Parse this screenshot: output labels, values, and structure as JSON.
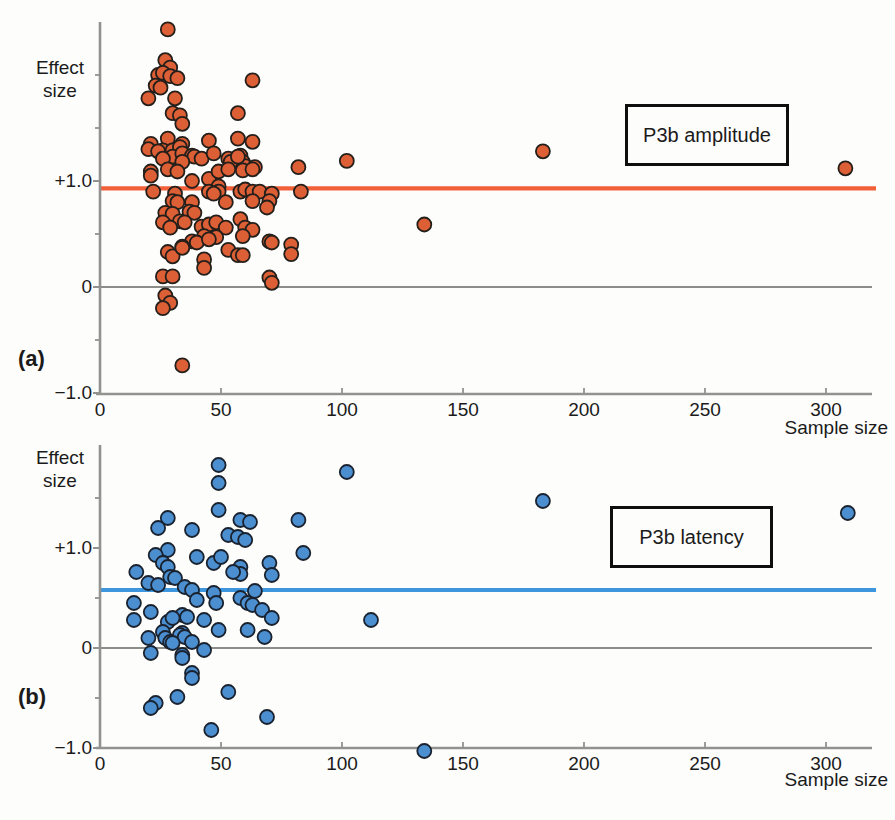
{
  "figure": {
    "background": "#fdfdfb",
    "text_color": "#1b1b1b",
    "axis_color": "#92928e",
    "zero_line_color": "#8c8c88"
  },
  "chart_data": [
    {
      "type": "scatter",
      "panel_label": "(a)",
      "legend_label": "P3b amplitude",
      "ylabel": "Effect size",
      "xlabel": "Sample size",
      "x_ticks": [
        0,
        50,
        100,
        150,
        200,
        250,
        300
      ],
      "y_labeled_ticks": [
        {
          "value": 1.0,
          "label": "+1.0"
        },
        {
          "value": 0,
          "label": "0"
        },
        {
          "value": -1.0,
          "label": "−1.0"
        }
      ],
      "y_minor_ticks": [
        -0.5,
        0.5,
        1.5,
        2.0
      ],
      "xlim": [
        0,
        319
      ],
      "ylim": [
        -1.05,
        2.52
      ],
      "grid": false,
      "legend_position": "upper right box",
      "grand_mean_effect_size": 0.93,
      "colors": {
        "point_fill": "#DC5F36",
        "point_stroke": "#241f1a",
        "mean_line": "#F2603A"
      },
      "points": [
        [
          28,
          2.43
        ],
        [
          27,
          2.14
        ],
        [
          29,
          2.07
        ],
        [
          24,
          2.0
        ],
        [
          26,
          2.02
        ],
        [
          29,
          1.99
        ],
        [
          32,
          1.97
        ],
        [
          23,
          1.9
        ],
        [
          25,
          1.88
        ],
        [
          20,
          1.78
        ],
        [
          31,
          1.78
        ],
        [
          63,
          1.95
        ],
        [
          30,
          1.64
        ],
        [
          33,
          1.62
        ],
        [
          34,
          1.54
        ],
        [
          57,
          1.64
        ],
        [
          28,
          1.4
        ],
        [
          57,
          1.4
        ],
        [
          63,
          1.37
        ],
        [
          21,
          1.35
        ],
        [
          34,
          1.35
        ],
        [
          20,
          1.3
        ],
        [
          26,
          1.29
        ],
        [
          30,
          1.29
        ],
        [
          33,
          1.32
        ],
        [
          45,
          1.38
        ],
        [
          24,
          1.28
        ],
        [
          30,
          1.23
        ],
        [
          34,
          1.26
        ],
        [
          38,
          1.24
        ],
        [
          39,
          1.23
        ],
        [
          42,
          1.21
        ],
        [
          47,
          1.26
        ],
        [
          53,
          1.21
        ],
        [
          58,
          1.24
        ],
        [
          59,
          1.18
        ],
        [
          60,
          1.14
        ],
        [
          26,
          1.21
        ],
        [
          34,
          1.18
        ],
        [
          82,
          1.13
        ],
        [
          102,
          1.19
        ],
        [
          21,
          1.09
        ],
        [
          28,
          1.11
        ],
        [
          32,
          1.09
        ],
        [
          38,
          1.0
        ],
        [
          45,
          1.02
        ],
        [
          49,
          1.09
        ],
        [
          54,
          1.18
        ],
        [
          59,
          1.1
        ],
        [
          64,
          1.13
        ],
        [
          53,
          1.11
        ],
        [
          57,
          1.23
        ],
        [
          63,
          1.11
        ],
        [
          21,
          1.05
        ],
        [
          49,
          0.95
        ],
        [
          22,
          0.9
        ],
        [
          31,
          0.88
        ],
        [
          30,
          0.81
        ],
        [
          32,
          0.8
        ],
        [
          38,
          0.8
        ],
        [
          45,
          0.9
        ],
        [
          49,
          0.9
        ],
        [
          52,
          0.8
        ],
        [
          58,
          0.9
        ],
        [
          60,
          0.92
        ],
        [
          63,
          0.9
        ],
        [
          66,
          0.9
        ],
        [
          71,
          0.88
        ],
        [
          63,
          0.81
        ],
        [
          70,
          0.81
        ],
        [
          69,
          0.75
        ],
        [
          83,
          0.9
        ],
        [
          47,
          0.88
        ],
        [
          27,
          0.7
        ],
        [
          30,
          0.69
        ],
        [
          37,
          0.71
        ],
        [
          39,
          0.7
        ],
        [
          33,
          0.62
        ],
        [
          26,
          0.61
        ],
        [
          29,
          0.56
        ],
        [
          35,
          0.61
        ],
        [
          42,
          0.57
        ],
        [
          45,
          0.59
        ],
        [
          48,
          0.61
        ],
        [
          52,
          0.56
        ],
        [
          58,
          0.64
        ],
        [
          60,
          0.56
        ],
        [
          63,
          0.54
        ],
        [
          59,
          0.48
        ],
        [
          43,
          0.48
        ],
        [
          48,
          0.47
        ],
        [
          38,
          0.43
        ],
        [
          53,
          0.35
        ],
        [
          70,
          0.43
        ],
        [
          79,
          0.4
        ],
        [
          79,
          0.31
        ],
        [
          71,
          0.42
        ],
        [
          28,
          0.33
        ],
        [
          30,
          0.29
        ],
        [
          34,
          0.38
        ],
        [
          40,
          0.42
        ],
        [
          45,
          0.45
        ],
        [
          34,
          0.37
        ],
        [
          43,
          0.26
        ],
        [
          43,
          0.18
        ],
        [
          57,
          0.3
        ],
        [
          59,
          0.3
        ],
        [
          70,
          0.09
        ],
        [
          26,
          0.1
        ],
        [
          30,
          0.1
        ],
        [
          71,
          0.04
        ],
        [
          27,
          -0.08
        ],
        [
          29,
          -0.15
        ],
        [
          26,
          -0.2
        ],
        [
          34,
          -0.74
        ],
        [
          134,
          0.59
        ],
        [
          183,
          1.28
        ],
        [
          308,
          1.12
        ]
      ]
    },
    {
      "type": "scatter",
      "panel_label": "(b)",
      "legend_label": "P3b latency",
      "ylabel": "Effect size",
      "xlabel": "Sample size",
      "x_ticks": [
        0,
        50,
        100,
        150,
        200,
        250,
        300
      ],
      "y_labeled_ticks": [
        {
          "value": 1.0,
          "label": "+1.0"
        },
        {
          "value": 0,
          "label": "0"
        },
        {
          "value": -1.0,
          "label": "−1.0"
        }
      ],
      "y_minor_ticks": [
        -0.5,
        0.5,
        1.5
      ],
      "xlim": [
        0,
        319
      ],
      "ylim": [
        -1.03,
        2.03
      ],
      "grid": false,
      "legend_position": "upper right box",
      "grand_mean_effect_size": 0.58,
      "colors": {
        "point_fill": "#4C8FD1",
        "point_stroke": "#19222e",
        "mean_line": "#3E97DE"
      },
      "points": [
        [
          49,
          1.83
        ],
        [
          49,
          1.65
        ],
        [
          102,
          1.76
        ],
        [
          28,
          1.3
        ],
        [
          24,
          1.2
        ],
        [
          49,
          1.38
        ],
        [
          58,
          1.28
        ],
        [
          62,
          1.26
        ],
        [
          38,
          1.18
        ],
        [
          53,
          1.13
        ],
        [
          57,
          1.11
        ],
        [
          60,
          1.08
        ],
        [
          82,
          1.28
        ],
        [
          84,
          0.95
        ],
        [
          28,
          0.98
        ],
        [
          23,
          0.93
        ],
        [
          26,
          0.85
        ],
        [
          28,
          0.81
        ],
        [
          40,
          0.91
        ],
        [
          47,
          0.85
        ],
        [
          50,
          0.91
        ],
        [
          58,
          0.81
        ],
        [
          58,
          0.74
        ],
        [
          70,
          0.85
        ],
        [
          71,
          0.73
        ],
        [
          55,
          0.76
        ],
        [
          15,
          0.76
        ],
        [
          20,
          0.65
        ],
        [
          29,
          0.71
        ],
        [
          31,
          0.7
        ],
        [
          24,
          0.63
        ],
        [
          35,
          0.61
        ],
        [
          38,
          0.58
        ],
        [
          14,
          0.45
        ],
        [
          21,
          0.36
        ],
        [
          40,
          0.48
        ],
        [
          47,
          0.55
        ],
        [
          48,
          0.45
        ],
        [
          58,
          0.5
        ],
        [
          61,
          0.45
        ],
        [
          63,
          0.43
        ],
        [
          67,
          0.38
        ],
        [
          71,
          0.3
        ],
        [
          64,
          0.57
        ],
        [
          34,
          0.33
        ],
        [
          36,
          0.31
        ],
        [
          28,
          0.26
        ],
        [
          30,
          0.3
        ],
        [
          43,
          0.28
        ],
        [
          14,
          0.28
        ],
        [
          26,
          0.16
        ],
        [
          34,
          0.15
        ],
        [
          49,
          0.18
        ],
        [
          61,
          0.18
        ],
        [
          68,
          0.11
        ],
        [
          27,
          0.1
        ],
        [
          29,
          0.06
        ],
        [
          33,
          0.13
        ],
        [
          35,
          0.11
        ],
        [
          38,
          0.06
        ],
        [
          20,
          0.1
        ],
        [
          30,
          0.05
        ],
        [
          112,
          0.28
        ],
        [
          43,
          -0.02
        ],
        [
          34,
          -0.07
        ],
        [
          21,
          -0.05
        ],
        [
          34,
          -0.1
        ],
        [
          38,
          -0.25
        ],
        [
          38,
          -0.3
        ],
        [
          32,
          -0.49
        ],
        [
          53,
          -0.44
        ],
        [
          23,
          -0.55
        ],
        [
          21,
          -0.6
        ],
        [
          69,
          -0.69
        ],
        [
          46,
          -0.82
        ],
        [
          134,
          -1.03
        ],
        [
          183,
          1.47
        ],
        [
          309,
          1.35
        ]
      ]
    }
  ]
}
